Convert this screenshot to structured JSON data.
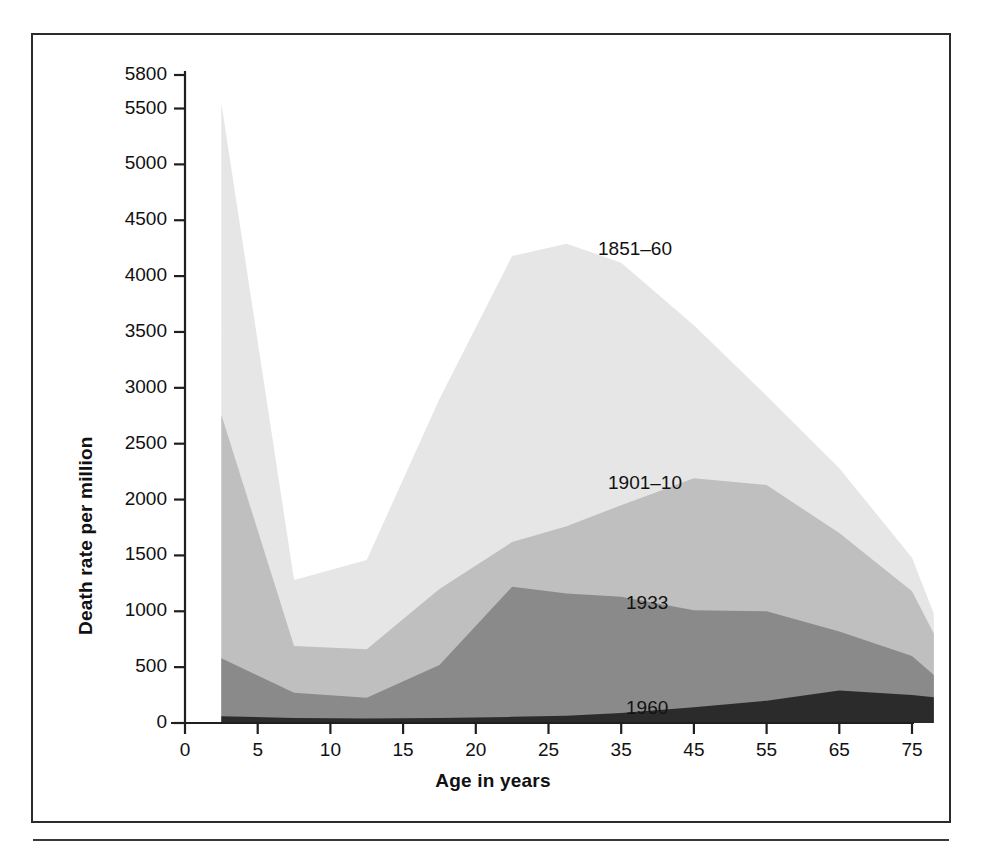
{
  "figure": {
    "x_axis_title": "Age in years",
    "y_axis_title": "Death rate per million",
    "caption": ""
  },
  "axes": {
    "y_ticks": [
      "5800",
      "5500",
      "5000",
      "4500",
      "4000",
      "3500",
      "3000",
      "2500",
      "2000",
      "1500",
      "1000",
      "500",
      "0"
    ],
    "x_ticks": [
      "0",
      "5",
      "10",
      "15",
      "20",
      "25",
      "35",
      "45",
      "55",
      "65",
      "75"
    ]
  },
  "series_labels": {
    "s1851": "1851–60",
    "s1901": "1901–10",
    "s1933": "1933",
    "s1960": "1960"
  },
  "colors": {
    "band_1851_60": "#e6e6e6",
    "band_1901_10": "#bfbfbf",
    "band_1933": "#8a8a8a",
    "band_1960": "#2b2b2b",
    "frame": "#2b2b2b",
    "text": "#111111"
  },
  "chart_data": {
    "type": "area",
    "stacked": false,
    "title": "",
    "xlabel": "Age in years",
    "ylabel": "Death rate per million",
    "xlim": [
      0,
      80
    ],
    "ylim": [
      0,
      5800
    ],
    "y_tick_values": [
      0,
      500,
      1000,
      1500,
      2000,
      2500,
      3000,
      3500,
      4000,
      4500,
      5000,
      5500,
      5800
    ],
    "x_tick_values": [
      0,
      5,
      10,
      15,
      20,
      25,
      35,
      45,
      55,
      65,
      75
    ],
    "x_axis_spacing": "categorical-even",
    "grid": false,
    "legend": "inline-annotations",
    "x": [
      2.5,
      7.5,
      12.5,
      17.5,
      22.5,
      27.5,
      35,
      45,
      55,
      65,
      75,
      78
    ],
    "series": [
      {
        "name": "1851–60",
        "color": "#e6e6e6",
        "values": [
          5550,
          1280,
          1460,
          2900,
          4180,
          4290,
          4120,
          3560,
          2930,
          2280,
          1480,
          980
        ]
      },
      {
        "name": "1901–10",
        "color": "#bfbfbf",
        "values": [
          2760,
          690,
          660,
          1200,
          1620,
          1760,
          1950,
          2190,
          2130,
          1700,
          1180,
          800
        ]
      },
      {
        "name": "1933",
        "color": "#8a8a8a",
        "values": [
          580,
          270,
          225,
          520,
          1220,
          1160,
          1130,
          1010,
          1000,
          820,
          600,
          430
        ]
      },
      {
        "name": "1960",
        "color": "#2b2b2b",
        "values": [
          60,
          45,
          40,
          45,
          55,
          65,
          90,
          140,
          200,
          290,
          250,
          230
        ]
      }
    ]
  }
}
